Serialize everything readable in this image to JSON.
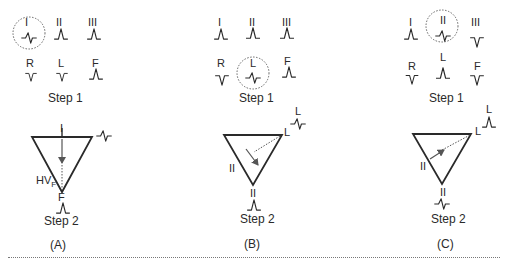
{
  "panels": [
    {
      "caption": "(A)",
      "step1_label": "Step 1",
      "step2_label": "Step 2",
      "leads": {
        "I": {
          "label": "I",
          "wave": "biphasic",
          "circled": true
        },
        "II": {
          "label": "II",
          "wave": "upright"
        },
        "III": {
          "label": "III",
          "wave": "upright"
        },
        "R": {
          "label": "R",
          "wave": "inverted"
        },
        "L": {
          "label": "L",
          "wave": "inverted"
        },
        "F": {
          "label": "F",
          "wave": "upright"
        }
      },
      "triangle": {
        "top_label": "I",
        "bottom_label": "F",
        "side_label": "HV",
        "side_label_sub": "F",
        "corner_wave": "biphasic",
        "bottom_wave": "upright",
        "axis": "vertical-down"
      }
    },
    {
      "caption": "(B)",
      "step1_label": "Step 1",
      "step2_label": "Step 2",
      "leads": {
        "I": {
          "label": "I",
          "wave": "upright"
        },
        "II": {
          "label": "II",
          "wave": "upright"
        },
        "III": {
          "label": "III",
          "wave": "upright"
        },
        "R": {
          "label": "R",
          "wave": "inverted"
        },
        "L": {
          "label": "L",
          "wave": "biphasic",
          "circled": true
        },
        "F": {
          "label": "F",
          "wave": "upright"
        }
      },
      "triangle": {
        "corner_label": "L",
        "corner_wave_label": "L",
        "corner_wave": "biphasic",
        "side_label": "II",
        "bottom_label": "II",
        "bottom_wave": "upright",
        "axis": "perpendicular-to-L"
      }
    },
    {
      "caption": "(C)",
      "step1_label": "Step 1",
      "step2_label": "Step 2",
      "leads": {
        "I": {
          "label": "I",
          "wave": "upright"
        },
        "II": {
          "label": "II",
          "wave": "biphasic",
          "circled": true
        },
        "III": {
          "label": "III",
          "wave": "inverted"
        },
        "R": {
          "label": "R",
          "wave": "inverted"
        },
        "L": {
          "label": "L",
          "wave": "upright"
        },
        "F": {
          "label": "F",
          "wave": "inverted"
        }
      },
      "triangle": {
        "corner_label": "L",
        "corner_wave_label": "L",
        "corner_wave": "upright",
        "side_label": "II",
        "bottom_label": "II",
        "bottom_wave": "biphasic",
        "axis": "toward-L"
      }
    }
  ],
  "colors": {
    "ink": "#2a2a2a",
    "dashed": "#555555",
    "divider": "#777777"
  }
}
